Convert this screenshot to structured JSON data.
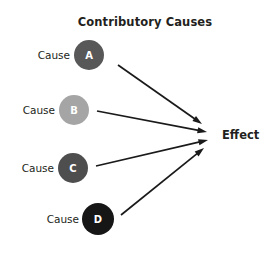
{
  "diagram": {
    "title": "Contributory Causes",
    "title_x": 145,
    "title_y": 26,
    "effect": {
      "label": "Effect",
      "x": 222,
      "y": 139
    },
    "nodes": [
      {
        "id": "a",
        "label": "Cause",
        "letter": "A",
        "label_x": 70,
        "label_y": 59,
        "cx": 89,
        "cy": 55,
        "r": 15,
        "color": "#585858"
      },
      {
        "id": "b",
        "label": "Cause",
        "letter": "B",
        "label_x": 55,
        "label_y": 114,
        "cx": 74,
        "cy": 110,
        "r": 15,
        "color": "#a5a5a5"
      },
      {
        "id": "c",
        "label": "Cause",
        "letter": "C",
        "label_x": 54,
        "label_y": 172,
        "cx": 73,
        "cy": 168,
        "r": 15,
        "color": "#4e4e4e"
      },
      {
        "id": "d",
        "label": "Cause",
        "letter": "D",
        "label_x": 79,
        "label_y": 223,
        "cx": 98,
        "cy": 219,
        "r": 16,
        "color": "#161616"
      }
    ],
    "arrows": [
      {
        "id": "a-to-effect",
        "from": "a",
        "x1": 118,
        "y1": 65,
        "x2": 202,
        "y2": 124
      },
      {
        "id": "b-to-effect",
        "from": "b",
        "x1": 97,
        "y1": 111,
        "x2": 207,
        "y2": 132
      },
      {
        "id": "c-to-effect",
        "from": "c",
        "x1": 96,
        "y1": 166,
        "x2": 208,
        "y2": 140
      },
      {
        "id": "d-to-effect",
        "from": "d",
        "x1": 121,
        "y1": 215,
        "x2": 204,
        "y2": 148
      }
    ],
    "colors": {
      "background": "#ffffff",
      "ink": "#231f20",
      "arrow": "#1a1a1a"
    }
  }
}
